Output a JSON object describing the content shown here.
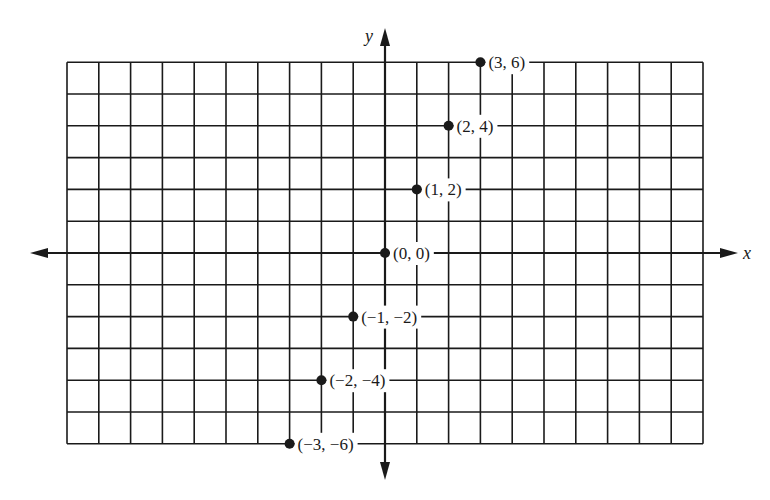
{
  "chart_data": {
    "type": "scatter",
    "title": "",
    "xlabel": "x",
    "ylabel": "y",
    "grid": true,
    "xlim": [
      -10,
      10
    ],
    "ylim": [
      -6,
      6
    ],
    "points": [
      {
        "x": 3,
        "y": 6,
        "label": "(3, 6)"
      },
      {
        "x": 2,
        "y": 4,
        "label": "(2, 4)"
      },
      {
        "x": 1,
        "y": 2,
        "label": "(1, 2)"
      },
      {
        "x": 0,
        "y": 0,
        "label": "(0, 0)"
      },
      {
        "x": -1,
        "y": -2,
        "label": "(−1, −2)"
      },
      {
        "x": -2,
        "y": -4,
        "label": "(−2, −4)"
      },
      {
        "x": -3,
        "y": -6,
        "label": "(−3, −6)"
      }
    ],
    "legend": null
  },
  "colors": {
    "ink": "#1a1a1a",
    "background": "#ffffff"
  }
}
